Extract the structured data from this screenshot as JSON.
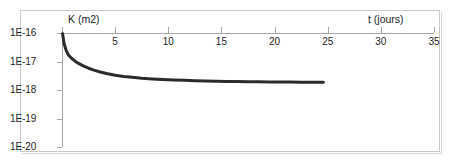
{
  "figure": {
    "background_color": "#ffffff",
    "frame_color": "#c9c9c9",
    "axis_color": "#a6a6a6",
    "curve_color": "#2b2b2b"
  },
  "chart_data": {
    "type": "line",
    "title": "",
    "xlabel": "t (jours)",
    "ylabel": "K (m2)",
    "x_axis_position": "top",
    "yscale": "log",
    "xlim": [
      0,
      35
    ],
    "ylim": [
      1e-20,
      1e-16
    ],
    "grid": false,
    "legend": null,
    "x_ticks": [
      0,
      5,
      10,
      15,
      20,
      25,
      30,
      35
    ],
    "x_tick_labels": [
      "",
      "5",
      "10",
      "15",
      "20",
      "25",
      "30",
      "35"
    ],
    "y_ticks": [
      1e-16,
      1e-17,
      1e-18,
      1e-19,
      1e-20
    ],
    "y_tick_labels": [
      "1E-16",
      "1E-17",
      "1E-18",
      "1E-19",
      "1E-20"
    ],
    "series": [
      {
        "name": "K",
        "x": [
          0.05,
          0.2,
          0.4,
          0.6,
          0.9,
          1.2,
          1.6,
          2.0,
          2.5,
          3.0,
          3.6,
          4.2,
          5.0,
          5.8,
          6.6,
          7.5,
          8.5,
          9.5,
          10.5,
          11.5,
          12.5,
          13.5,
          14.5,
          15.5,
          16.5,
          17.5,
          18.5,
          19.5,
          20.5,
          21.5,
          22.5,
          23.4,
          24.2,
          24.6
        ],
        "y": [
          9.5e-17,
          4.2e-17,
          2.4e-17,
          1.7e-17,
          1.3e-17,
          1.05e-17,
          8.4e-18,
          7e-18,
          5.8e-18,
          5e-18,
          4.3e-18,
          3.8e-18,
          3.3e-18,
          3e-18,
          2.8e-18,
          2.6e-18,
          2.45e-18,
          2.35e-18,
          2.25e-18,
          2.18e-18,
          2.12e-18,
          2.07e-18,
          2.03e-18,
          2e-18,
          1.97e-18,
          1.95e-18,
          1.93e-18,
          1.91e-18,
          1.9e-18,
          1.89e-18,
          1.88e-18,
          1.87e-18,
          1.87e-18,
          1.86e-18
        ]
      }
    ]
  }
}
